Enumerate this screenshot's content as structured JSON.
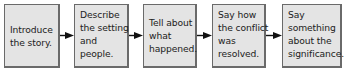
{
  "diagram": {
    "type": "flowchart",
    "direction": "left-to-right",
    "colors": {
      "box_fill": "#e4e4e4",
      "box_border": "#6a6a6a",
      "text": "#222222",
      "arrow": "#111111"
    },
    "steps": [
      {
        "lines": [
          "Introduce",
          "the story."
        ]
      },
      {
        "lines": [
          "Describe",
          "the setting",
          "and",
          "people."
        ]
      },
      {
        "lines": [
          "Tell about",
          "what",
          "happened."
        ]
      },
      {
        "lines": [
          "Say how",
          "the conflict",
          "was",
          "resolved."
        ]
      },
      {
        "lines": [
          "Say",
          "something",
          "about the",
          "significance."
        ]
      }
    ],
    "connectors": [
      {
        "from": 0,
        "to": 1,
        "icon": "arrow-right-icon"
      },
      {
        "from": 1,
        "to": 2,
        "icon": "arrow-right-icon"
      },
      {
        "from": 2,
        "to": 3,
        "icon": "arrow-right-icon"
      },
      {
        "from": 3,
        "to": 4,
        "icon": "arrow-right-icon"
      }
    ]
  }
}
